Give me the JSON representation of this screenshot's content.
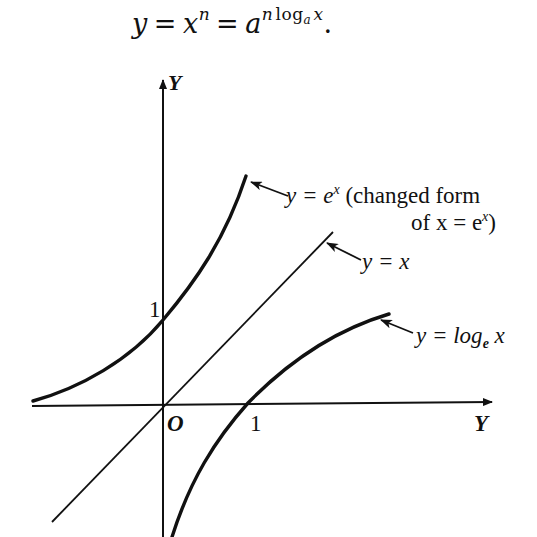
{
  "equation": {
    "lhs": "y",
    "eq1": "=",
    "base": "x",
    "exp": "n",
    "eq2": "=",
    "base2": "a",
    "exp2_n": "n",
    "exp2_log": "log",
    "exp2_sub": "a",
    "exp2_x": "x",
    "period": "."
  },
  "diagram": {
    "axes": {
      "y_axis_label": "Y",
      "x_axis_label": "Y",
      "origin_label": "O",
      "y_tick_label": "1",
      "x_tick_label": "1"
    },
    "curves": [
      {
        "name": "exp",
        "label_prefix": "y = e",
        "label_sup": "x",
        "label_note_1": " (changed form",
        "label_note_2_prefix": "of x = e",
        "label_note_2_sup": "x",
        "label_note_2_suffix": ")"
      },
      {
        "name": "identity",
        "label": "y = x"
      },
      {
        "name": "log",
        "label_prefix": "y = log",
        "label_sub": "e",
        "label_suffix": " x"
      }
    ],
    "colors": {
      "ink": "#111111",
      "background": "#ffffff"
    }
  }
}
